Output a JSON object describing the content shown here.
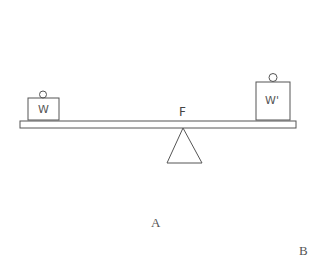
{
  "diagram": {
    "type": "lever-balance",
    "labels": {
      "weight_left": "W",
      "weight_right": "W'",
      "fulcrum": "F",
      "label_a": "A",
      "label_b": "B"
    },
    "colors": {
      "stroke": "#555555",
      "background": "#ffffff"
    }
  }
}
